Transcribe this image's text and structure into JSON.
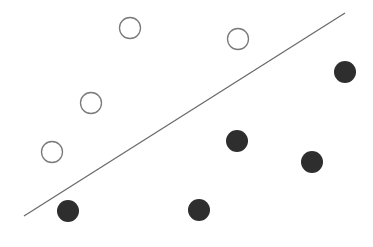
{
  "diagram": {
    "type": "linear-separator-classification",
    "classes": [
      {
        "name": "open",
        "fill": "#ffffff",
        "stroke": "#7a7a7a"
      },
      {
        "name": "filled",
        "fill": "#2e2e2e",
        "stroke": "#2e2e2e"
      }
    ],
    "separator_color": "#666666"
  }
}
